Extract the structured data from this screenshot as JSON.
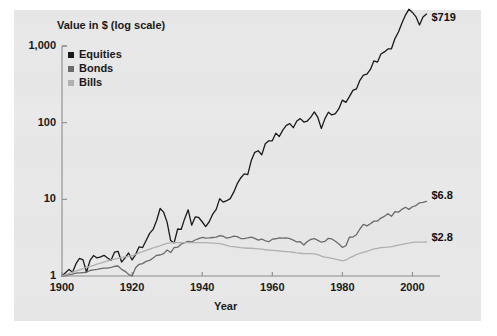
{
  "chart_data": {
    "type": "line",
    "title": "",
    "xlabel": "Year",
    "ylabel": "Value in $ (log scale)",
    "yscale": "log",
    "ylim": [
      1,
      1000
    ],
    "xlim": [
      1900,
      2005
    ],
    "grid": false,
    "legend_position": "top-left",
    "y_ticks": [
      "1",
      "10",
      "100",
      "1,000"
    ],
    "y_tick_values": [
      1,
      10,
      100,
      1000
    ],
    "x_ticks": [
      "1900",
      "1920",
      "1940",
      "1960",
      "1980",
      "2000"
    ],
    "x_tick_values": [
      1900,
      1920,
      1940,
      1960,
      1980,
      2000
    ],
    "colors": {
      "equities": "#1a1a1a",
      "bonds": "#6b6b6b",
      "bills": "#b0b0b0",
      "panel_background": "#e6e6e6",
      "page_background": "#ffffff",
      "axis": "#808080",
      "text": "#1a1a1a"
    },
    "end_labels": [
      {
        "series": "Equities",
        "text": "$719",
        "value": 719
      },
      {
        "series": "Bonds",
        "text": "$6.8",
        "value": 6.8
      },
      {
        "series": "Bills",
        "text": "$2.8",
        "value": 2.8
      }
    ],
    "x": [
      1900,
      1901,
      1902,
      1903,
      1904,
      1905,
      1906,
      1907,
      1908,
      1909,
      1910,
      1911,
      1912,
      1913,
      1914,
      1915,
      1916,
      1917,
      1918,
      1919,
      1920,
      1921,
      1922,
      1923,
      1924,
      1925,
      1926,
      1927,
      1928,
      1929,
      1930,
      1931,
      1932,
      1933,
      1934,
      1935,
      1936,
      1937,
      1938,
      1939,
      1940,
      1941,
      1942,
      1943,
      1944,
      1945,
      1946,
      1947,
      1948,
      1949,
      1950,
      1951,
      1952,
      1953,
      1954,
      1955,
      1956,
      1957,
      1958,
      1959,
      1960,
      1961,
      1962,
      1963,
      1964,
      1965,
      1966,
      1967,
      1968,
      1969,
      1970,
      1971,
      1972,
      1973,
      1974,
      1975,
      1976,
      1977,
      1978,
      1979,
      1980,
      1981,
      1982,
      1983,
      1984,
      1985,
      1986,
      1987,
      1988,
      1989,
      1990,
      1991,
      1992,
      1993,
      1994,
      1995,
      1996,
      1997,
      1998,
      1999,
      2000,
      2001,
      2002,
      2003,
      2004
    ],
    "series": [
      {
        "name": "Equities",
        "color": "#1a1a1a",
        "values": [
          1.0,
          1.1,
          1.22,
          1.12,
          1.45,
          1.7,
          1.62,
          1.12,
          1.6,
          1.85,
          1.72,
          1.78,
          1.86,
          1.72,
          1.6,
          2.05,
          2.1,
          1.52,
          1.72,
          2.0,
          1.62,
          1.9,
          2.4,
          2.35,
          2.9,
          3.6,
          4.05,
          5.3,
          7.6,
          6.8,
          5.0,
          2.9,
          2.7,
          4.1,
          4.05,
          5.6,
          7.3,
          4.6,
          5.9,
          5.8,
          5.1,
          4.4,
          5.1,
          6.4,
          7.4,
          10.2,
          9.2,
          9.6,
          10.2,
          12.4,
          16.0,
          19.0,
          21.5,
          21.0,
          32.0,
          41.0,
          43.0,
          38.0,
          53.0,
          58.0,
          58.0,
          73.0,
          66.0,
          80.0,
          92.0,
          97.0,
          86.0,
          105.0,
          113.0,
          102.0,
          105.0,
          118.0,
          138.0,
          117.0,
          84.0,
          112.0,
          137.0,
          126.0,
          131.0,
          152.0,
          197.0,
          184.0,
          219.0,
          264.0,
          275.0,
          357.0,
          417.0,
          430.0,
          494.0,
          641.0,
          615.0,
          785.0,
          838.0,
          915.0,
          920.0,
          1250.0,
          1520.0,
          1990.0,
          2530.0,
          3020.0,
          2740.0,
          2400.0,
          1880.0,
          2390.0,
          2610.0
        ]
      },
      {
        "name": "Bonds",
        "color": "#6b6b6b",
        "values": [
          1.0,
          1.02,
          1.04,
          1.06,
          1.09,
          1.1,
          1.11,
          1.12,
          1.18,
          1.2,
          1.22,
          1.25,
          1.27,
          1.27,
          1.3,
          1.34,
          1.35,
          1.22,
          1.15,
          1.05,
          1.0,
          1.28,
          1.42,
          1.45,
          1.55,
          1.6,
          1.72,
          1.86,
          1.88,
          1.96,
          2.18,
          2.02,
          2.34,
          2.38,
          2.6,
          2.72,
          2.82,
          2.78,
          2.95,
          3.08,
          3.2,
          3.12,
          3.14,
          3.18,
          3.22,
          3.36,
          3.3,
          3.12,
          3.18,
          3.32,
          3.26,
          3.08,
          3.08,
          3.14,
          3.22,
          3.1,
          2.94,
          3.02,
          2.88,
          2.8,
          3.02,
          3.06,
          3.14,
          3.12,
          3.14,
          3.08,
          2.94,
          2.78,
          2.8,
          2.54,
          2.82,
          3.0,
          3.08,
          2.92,
          2.76,
          2.82,
          3.1,
          3.04,
          2.84,
          2.62,
          2.36,
          2.48,
          3.2,
          3.22,
          3.46,
          4.1,
          4.7,
          4.5,
          4.8,
          5.2,
          5.2,
          5.7,
          6.0,
          6.5,
          6.0,
          6.9,
          6.8,
          7.4,
          7.9,
          7.4,
          8.0,
          8.3,
          9.0,
          9.1,
          9.4
        ]
      },
      {
        "name": "Bills",
        "color": "#b0b0b0",
        "values": [
          1.0,
          1.04,
          1.08,
          1.12,
          1.16,
          1.2,
          1.25,
          1.3,
          1.34,
          1.38,
          1.43,
          1.47,
          1.52,
          1.57,
          1.62,
          1.66,
          1.7,
          1.74,
          1.78,
          1.8,
          1.84,
          1.92,
          2.0,
          2.08,
          2.16,
          2.24,
          2.32,
          2.4,
          2.48,
          2.58,
          2.66,
          2.7,
          2.72,
          2.72,
          2.72,
          2.72,
          2.72,
          2.72,
          2.72,
          2.72,
          2.72,
          2.72,
          2.7,
          2.68,
          2.66,
          2.64,
          2.58,
          2.5,
          2.44,
          2.42,
          2.38,
          2.34,
          2.32,
          2.3,
          2.3,
          2.28,
          2.26,
          2.24,
          2.2,
          2.18,
          2.16,
          2.14,
          2.12,
          2.1,
          2.08,
          2.06,
          2.04,
          2.0,
          1.98,
          1.96,
          1.96,
          1.96,
          1.94,
          1.9,
          1.82,
          1.76,
          1.74,
          1.7,
          1.66,
          1.62,
          1.58,
          1.62,
          1.72,
          1.8,
          1.9,
          1.98,
          2.04,
          2.1,
          2.18,
          2.26,
          2.3,
          2.34,
          2.36,
          2.38,
          2.42,
          2.48,
          2.52,
          2.58,
          2.64,
          2.68,
          2.74,
          2.76,
          2.76,
          2.76,
          2.78
        ]
      }
    ]
  },
  "legend": {
    "items": [
      {
        "label": "Equities",
        "color": "#1a1a1a"
      },
      {
        "label": "Bonds",
        "color": "#6b6b6b"
      },
      {
        "label": "Bills",
        "color": "#b0b0b0"
      }
    ]
  },
  "axes": {
    "y_title": "Value in $ (log scale)",
    "x_title": "Year",
    "y_tick_labels": [
      "1,000",
      "100",
      "10",
      "1"
    ],
    "x_tick_labels": [
      "1900",
      "1920",
      "1940",
      "1960",
      "1980",
      "2000"
    ]
  },
  "annotations": {
    "equities_end": "$719",
    "bonds_end": "$6.8",
    "bills_end": "$2.8"
  }
}
